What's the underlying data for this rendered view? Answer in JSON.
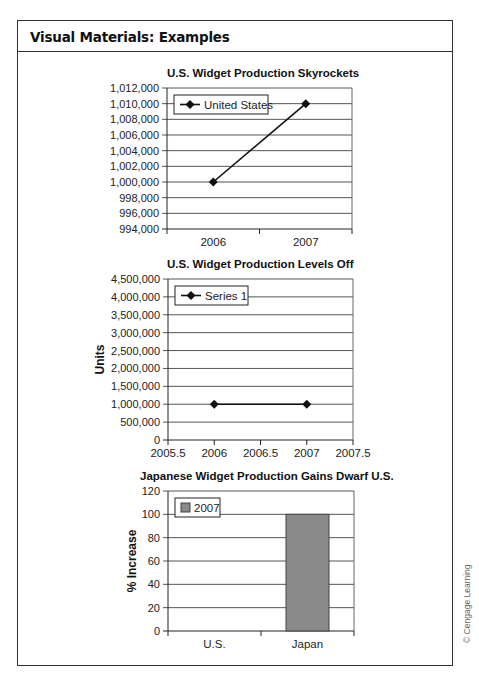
{
  "header": {
    "title": "Visual Materials: Examples"
  },
  "credit": "© Cengage Learning",
  "charts": [
    {
      "title": "U.S. Widget Production Skyrockets",
      "legend": "United States",
      "ylabel": "",
      "yticks": [
        "1,012,000",
        "1,010,000",
        "1,008,000",
        "1,006,000",
        "1,004,000",
        "1,002,000",
        "1,000,000",
        "998,000",
        "996,000",
        "994,000"
      ],
      "xticks": [
        "2006",
        "2007"
      ]
    },
    {
      "title": "U.S. Widget Production Levels Off",
      "legend": "Series 1",
      "ylabel": "Units",
      "yticks": [
        "4,500,000",
        "4,000,000",
        "3,500,000",
        "3,000,000",
        "2,500,000",
        "2,000,000",
        "1,500,000",
        "1,000,000",
        "500,000",
        "0"
      ],
      "xticks": [
        "2005.5",
        "2006",
        "2006.5",
        "2007",
        "2007.5"
      ]
    },
    {
      "title": "Japanese Widget Production Gains Dwarf U.S.",
      "legend": "2007",
      "ylabel": "% Increase",
      "yticks": [
        "120",
        "100",
        "80",
        "60",
        "40",
        "20",
        "0"
      ],
      "xticks": [
        "U.S.",
        "Japan"
      ]
    }
  ],
  "colors": {
    "line": "#111111",
    "bar_fill": "#8a8a8a",
    "bar_border": "#444444",
    "grid": "#555555"
  },
  "chart_data": [
    {
      "type": "line",
      "title": "U.S. Widget Production Skyrockets",
      "categories": [
        "2006",
        "2007"
      ],
      "series": [
        {
          "name": "United States",
          "values": [
            1000000,
            1010000
          ]
        }
      ],
      "xlabel": "",
      "ylabel": "",
      "ylim": [
        994000,
        1012000
      ],
      "ytick_step": 2000,
      "grid": true,
      "legend_position": "top-left inside"
    },
    {
      "type": "scatter",
      "title": "U.S. Widget Production Levels Off",
      "x": [
        2006,
        2007
      ],
      "series": [
        {
          "name": "Series 1",
          "values": [
            1000000,
            1000000
          ]
        }
      ],
      "xlabel": "",
      "ylabel": "Units",
      "xlim": [
        2005.5,
        2007.5
      ],
      "ylim": [
        0,
        4500000
      ],
      "ytick_step": 500000,
      "grid": true,
      "legend_position": "top-left inside"
    },
    {
      "type": "bar",
      "title": "Japanese Widget Production Gains Dwarf U.S.",
      "categories": [
        "U.S.",
        "Japan"
      ],
      "series": [
        {
          "name": "2007",
          "values": [
            0,
            100
          ]
        }
      ],
      "xlabel": "",
      "ylabel": "% Increase",
      "ylim": [
        0,
        120
      ],
      "ytick_step": 20,
      "grid": true,
      "legend_position": "top-left inside"
    }
  ]
}
